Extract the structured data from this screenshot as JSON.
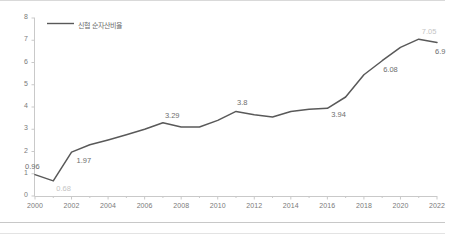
{
  "chart_data": {
    "type": "line",
    "title": "",
    "subtitle": "",
    "xlabel": "",
    "ylabel": "",
    "legend": [
      "신협 순자산비율"
    ],
    "legend_position": "top-left",
    "grid": false,
    "markers": false,
    "line_color": "#595959",
    "label_color": "#6e6e6e",
    "faint_label_color": "#c4c4c4",
    "xlim": [
      2000,
      2022
    ],
    "ylim": [
      0,
      8
    ],
    "yticks": [
      "0",
      "1",
      "2",
      "3",
      "4",
      "5",
      "6",
      "7",
      "8"
    ],
    "xticks": [
      "2000",
      "2002",
      "2004",
      "2006",
      "2008",
      "2010",
      "2012",
      "2014",
      "2016",
      "2018",
      "2020",
      "2022"
    ],
    "x": [
      2000,
      2001,
      2002,
      2003,
      2004,
      2005,
      2006,
      2007,
      2008,
      2009,
      2010,
      2011,
      2012,
      2013,
      2014,
      2015,
      2016,
      2017,
      2018,
      2019,
      2020,
      2021,
      2022
    ],
    "values": [
      0.96,
      0.68,
      1.97,
      2.3,
      2.52,
      2.75,
      3.0,
      3.29,
      3.1,
      3.1,
      3.4,
      3.8,
      3.65,
      3.55,
      3.8,
      3.9,
      3.94,
      4.45,
      5.45,
      6.08,
      6.68,
      7.05,
      6.9
    ],
    "series": [
      {
        "name": "신협 순자산비율",
        "values": [
          0.96,
          0.68,
          1.97,
          2.3,
          2.52,
          2.75,
          3.0,
          3.29,
          3.1,
          3.1,
          3.4,
          3.8,
          3.65,
          3.55,
          3.8,
          3.9,
          3.94,
          4.45,
          5.45,
          6.08,
          6.68,
          7.05,
          6.9
        ]
      }
    ],
    "annotations": [
      {
        "year": 2000,
        "text": "0.96",
        "faint": false
      },
      {
        "year": 2001,
        "text": "0.68",
        "faint": true
      },
      {
        "year": 2002,
        "text": "1.97",
        "faint": false
      },
      {
        "year": 2007,
        "text": "3.29",
        "faint": false
      },
      {
        "year": 2011,
        "text": "3.8",
        "faint": false
      },
      {
        "year": 2016,
        "text": "3.94",
        "faint": false
      },
      {
        "year": 2019,
        "text": "6.08",
        "faint": false
      },
      {
        "year": 2021,
        "text": "7.05",
        "faint": true
      },
      {
        "year": 2022,
        "text": "6.9",
        "faint": false
      }
    ]
  }
}
